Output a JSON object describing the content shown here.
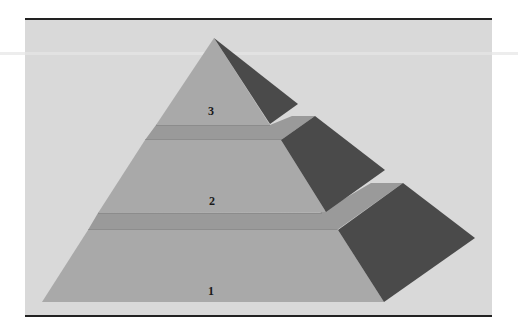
{
  "diagram": {
    "type": "pyramid",
    "levels": [
      {
        "label": "3",
        "position": "top"
      },
      {
        "label": "2",
        "position": "middle"
      },
      {
        "label": "1",
        "position": "bottom"
      }
    ],
    "colors": {
      "background_panel": "#d9d9d9",
      "face_front": "#a9a9a9",
      "ledge": "#9a9a9a",
      "face_side_dark": "#4a4a4a",
      "rule": "#222222"
    }
  }
}
